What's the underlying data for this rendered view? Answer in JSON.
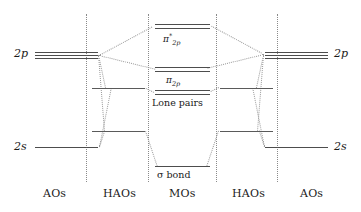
{
  "diagram": {
    "columns": [
      {
        "id": "aos-left",
        "label": "AOs",
        "x": 43
      },
      {
        "id": "haos-left",
        "label": "HAOs",
        "x": 117
      },
      {
        "id": "mos",
        "label": "MOs",
        "x": 182
      },
      {
        "id": "haos-right",
        "label": "HAOs",
        "x": 246
      },
      {
        "id": "aos-right",
        "label": "AOs",
        "x": 318
      }
    ],
    "dividers": [
      86,
      148,
      216,
      277
    ],
    "levels": {
      "ao_left_2p": {
        "label": "2p",
        "degeneracy": 3,
        "y": 55,
        "x1": 35,
        "x2": 98
      },
      "ao_left_2s": {
        "label": "2s",
        "degeneracy": 1,
        "y": 147,
        "x1": 35,
        "x2": 98
      },
      "ao_right_2p": {
        "label": "2p",
        "degeneracy": 3,
        "y": 55,
        "x1": 265,
        "x2": 328
      },
      "ao_right_2s": {
        "label": "2s",
        "degeneracy": 1,
        "y": 147,
        "x1": 265,
        "x2": 328
      },
      "hao_left_upper": {
        "label": "",
        "degeneracy": 1,
        "y": 88,
        "x1": 92,
        "x2": 145
      },
      "hao_left_lower": {
        "label": "",
        "degeneracy": 1,
        "y": 131,
        "x1": 92,
        "x2": 145
      },
      "hao_right_upper": {
        "label": "",
        "degeneracy": 1,
        "y": 88,
        "x1": 220,
        "x2": 273
      },
      "hao_right_lower": {
        "label": "",
        "degeneracy": 1,
        "y": 131,
        "x1": 220,
        "x2": 273
      },
      "mo_pi_star": {
        "label": "π*2p",
        "degeneracy": 2,
        "y": 26,
        "x1": 155,
        "x2": 210
      },
      "mo_pi": {
        "label": "π2p",
        "degeneracy": 2,
        "y": 69,
        "x1": 155,
        "x2": 210
      },
      "mo_lone_pairs": {
        "label": "Lone pairs",
        "degeneracy": 2,
        "y": 92,
        "x1": 155,
        "x2": 210
      },
      "mo_sigma": {
        "label": "σ bond",
        "degeneracy": 1,
        "y": 166,
        "x1": 155,
        "x2": 210
      }
    },
    "level_labels": {
      "ao_left_2p": "2p",
      "ao_left_2s": "2s",
      "ao_right_2p": "2p",
      "ao_right_2s": "2s",
      "pi_star_greek": "π",
      "pi_star_sup": "*",
      "pi_star_sub": "2p",
      "pi_greek": "π",
      "pi_sub": "2p",
      "lone_pairs": "Lone pairs",
      "sigma_greek": "σ",
      "sigma_word": "bond"
    },
    "colors": {
      "level_line": "#4d4d4d",
      "correlation_line": "#9a9a9a",
      "divider": "#8a8a8a",
      "text": "#1a1a1a",
      "background": "#ffffff"
    }
  }
}
